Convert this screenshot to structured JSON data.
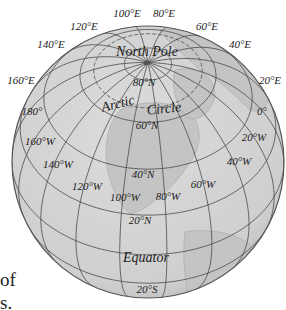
{
  "globe": {
    "center_x": 148,
    "center_y": 162,
    "radius": 136,
    "view_center_lat": 43,
    "view_center_lon": -88,
    "fill_color": "#d3d3d3",
    "land_color": "#c6c6c6",
    "outline_color": "#555555",
    "grid_color": "#4a4a4a",
    "parallels": [
      -20,
      0,
      20,
      40,
      60,
      66.5,
      80
    ],
    "meridians": [
      0,
      20,
      40,
      60,
      80,
      100,
      120,
      140,
      160,
      180,
      -20,
      -40,
      -60,
      -80,
      -100,
      -120,
      -140,
      -160
    ]
  },
  "labels": {
    "north_pole": "North Pole",
    "arctic_circle_1": "Arctic",
    "arctic_circle_2": "Circle",
    "equator": "Equator",
    "lat_80n": "80°N",
    "lat_60n": "60°N",
    "lat_40n": "40°N",
    "lat_20n": "20°N",
    "lat_20s": "20°S",
    "lon_100e": "100°E",
    "lon_80e": "80°E",
    "lon_120e": "120°E",
    "lon_60e": "60°E",
    "lon_140e": "140°E",
    "lon_40e": "40°E",
    "lon_160e": "160°E",
    "lon_20e": "20°E",
    "lon_180": "180°",
    "lon_0": "0°",
    "lon_160w": "160°W",
    "lon_20w": "20°W",
    "lon_140w": "140°W",
    "lon_40w": "40°W",
    "lon_120w": "120°W",
    "lon_100w": "100°W",
    "lon_80w": "80°W",
    "lon_60w": "60°W"
  },
  "side_text": {
    "line1": "of",
    "line2": "s."
  }
}
